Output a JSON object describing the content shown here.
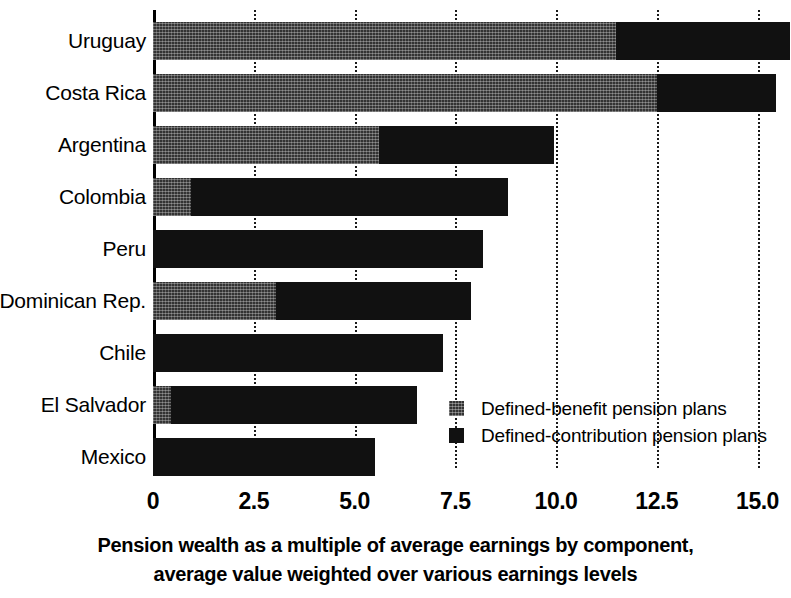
{
  "chart_data": {
    "type": "bar",
    "orientation": "horizontal",
    "stacked": true,
    "title": "Pension wealth as a multiple of average earnings by component, average value weighted over various earnings levels",
    "title_lines": [
      "Pension wealth as a multiple of average earnings by component,",
      "average value weighted over various earnings levels"
    ],
    "xlabel": "",
    "ylabel": "",
    "xlim": [
      0,
      15.8
    ],
    "xticks": [
      0,
      2.5,
      5.0,
      7.5,
      10.0,
      12.5,
      15.0
    ],
    "xtick_labels": [
      "0",
      "2.5",
      "5.0",
      "7.5",
      "10.0",
      "12.5",
      "15.0"
    ],
    "grid": "vertical-dotted",
    "legend_position": "inside-right-lower",
    "categories": [
      "Uruguay",
      "Costa Rica",
      "Argentina",
      "Colombia",
      "Peru",
      "Dominican Rep.",
      "Chile",
      "El Salvador",
      "Mexico"
    ],
    "series": [
      {
        "name": "Defined-benefit pension plans",
        "color": "#333333",
        "pattern": "cross-hatch",
        "values": [
          11.5,
          12.5,
          5.6,
          0.95,
          0.0,
          3.05,
          0.0,
          0.45,
          0.0
        ]
      },
      {
        "name": "Defined-contribution pension plans",
        "color": "#111111",
        "pattern": "solid",
        "values": [
          4.3,
          2.95,
          4.35,
          7.85,
          8.2,
          4.85,
          7.2,
          6.1,
          5.5
        ]
      }
    ],
    "totals": [
      15.8,
      15.45,
      9.95,
      8.8,
      8.2,
      7.9,
      7.2,
      6.55,
      5.5
    ]
  },
  "legend": {
    "items": [
      {
        "label": "Defined-benefit pension plans",
        "swatch": "db"
      },
      {
        "label": "Defined-contribution pension plans",
        "swatch": "dc"
      }
    ]
  },
  "colors": {
    "defined_benefit": "#333333",
    "defined_contribution": "#111111",
    "axis": "#000000",
    "gridline": "#1a1a1a",
    "background": "#ffffff"
  }
}
